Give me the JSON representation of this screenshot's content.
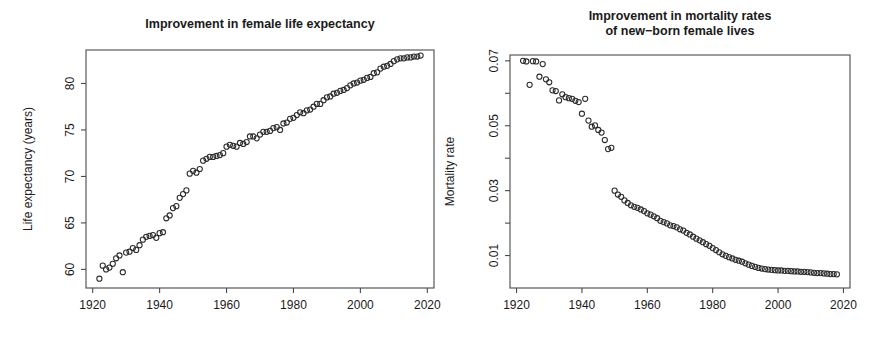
{
  "figure": {
    "background": "#ffffff",
    "point_color": "#2b2b2b",
    "axis_color": "#4a4a4a",
    "text_color": "#1a1a1a"
  },
  "chart_data": [
    {
      "type": "scatter",
      "id": "female-life-expectancy",
      "title": "Improvement in female life expectancy",
      "title_lines": [
        "Improvement in female life expectancy"
      ],
      "xlabel": "",
      "ylabel": "Life expectancy (years)",
      "xlim": [
        1918,
        2022
      ],
      "ylim": [
        58.0,
        83.6
      ],
      "grid": false,
      "legend": "none",
      "xticks": [
        1920,
        1940,
        1960,
        1980,
        2000,
        2020
      ],
      "xtick_labels": [
        "1920",
        "1940",
        "1960",
        "1980",
        "2000",
        "2020"
      ],
      "yticks": [
        60,
        65,
        70,
        75,
        80
      ],
      "ytick_labels": [
        "60",
        "65",
        "70",
        "75",
        "80"
      ],
      "marker": "open-circle",
      "x": [
        1922,
        1923,
        1924,
        1925,
        1926,
        1927,
        1928,
        1929,
        1930,
        1931,
        1932,
        1933,
        1934,
        1935,
        1936,
        1937,
        1938,
        1939,
        1940,
        1941,
        1942,
        1943,
        1944,
        1945,
        1946,
        1947,
        1948,
        1949,
        1950,
        1951,
        1952,
        1953,
        1954,
        1955,
        1956,
        1957,
        1958,
        1959,
        1960,
        1961,
        1962,
        1963,
        1964,
        1965,
        1966,
        1967,
        1968,
        1969,
        1970,
        1971,
        1972,
        1973,
        1974,
        1975,
        1976,
        1977,
        1978,
        1979,
        1980,
        1981,
        1982,
        1983,
        1984,
        1985,
        1986,
        1987,
        1988,
        1989,
        1990,
        1991,
        1992,
        1993,
        1994,
        1995,
        1996,
        1997,
        1998,
        1999,
        2000,
        2001,
        2002,
        2003,
        2004,
        2005,
        2006,
        2007,
        2008,
        2009,
        2010,
        2011,
        2012,
        2013,
        2014,
        2015,
        2016,
        2017,
        2018
      ],
      "y": [
        59.0,
        60.4,
        60.0,
        60.2,
        60.6,
        61.2,
        61.5,
        59.7,
        61.8,
        61.9,
        62.3,
        62.1,
        62.6,
        63.2,
        63.5,
        63.6,
        63.7,
        63.4,
        63.9,
        64.0,
        65.5,
        65.8,
        66.6,
        66.8,
        67.7,
        68.1,
        68.5,
        70.3,
        70.6,
        70.4,
        70.8,
        71.7,
        71.9,
        72.1,
        72.1,
        72.2,
        72.3,
        72.5,
        73.2,
        73.4,
        73.3,
        73.2,
        73.6,
        73.5,
        73.7,
        74.3,
        74.3,
        74.1,
        74.5,
        74.8,
        74.8,
        74.9,
        75.2,
        75.3,
        75.0,
        75.7,
        75.8,
        76.2,
        76.3,
        76.6,
        76.9,
        76.8,
        77.1,
        77.2,
        77.5,
        77.8,
        77.8,
        78.2,
        78.5,
        78.6,
        78.9,
        79.0,
        79.2,
        79.3,
        79.5,
        79.8,
        80.0,
        80.1,
        80.3,
        80.4,
        80.6,
        80.7,
        81.1,
        81.2,
        81.6,
        81.8,
        81.9,
        82.1,
        82.4,
        82.6,
        82.7,
        82.7,
        82.8,
        82.8,
        82.9,
        82.9,
        83.0
      ]
    },
    {
      "type": "scatter",
      "id": "newborn-female-mortality",
      "title": "Improvement in mortality rates of new-born female lives",
      "title_lines": [
        "Improvement in mortality rates",
        "of new−born female lives"
      ],
      "xlabel": "",
      "ylabel": "Mortality rate",
      "xlim": [
        1918,
        2022
      ],
      "ylim": [
        0.0,
        0.0718
      ],
      "grid": false,
      "legend": "none",
      "xticks": [
        1920,
        1940,
        1960,
        1980,
        2000,
        2020
      ],
      "xtick_labels": [
        "1920",
        "1940",
        "1960",
        "1980",
        "2000",
        "2020"
      ],
      "yticks": [
        0.01,
        0.02,
        0.03,
        0.04,
        0.05,
        0.06,
        0.07
      ],
      "ytick_labels": [
        "0.01",
        "",
        "0.03",
        "",
        "0.05",
        "",
        "0.07"
      ],
      "marker": "open-circle",
      "x": [
        1922,
        1923,
        1924,
        1925,
        1926,
        1927,
        1928,
        1929,
        1930,
        1931,
        1932,
        1933,
        1934,
        1935,
        1936,
        1937,
        1938,
        1939,
        1940,
        1941,
        1942,
        1943,
        1944,
        1945,
        1946,
        1947,
        1948,
        1949,
        1950,
        1951,
        1952,
        1953,
        1954,
        1955,
        1956,
        1957,
        1958,
        1959,
        1960,
        1961,
        1962,
        1963,
        1964,
        1965,
        1966,
        1967,
        1968,
        1969,
        1970,
        1971,
        1972,
        1973,
        1974,
        1975,
        1976,
        1977,
        1978,
        1979,
        1980,
        1981,
        1982,
        1983,
        1984,
        1985,
        1986,
        1987,
        1988,
        1989,
        1990,
        1991,
        1992,
        1993,
        1994,
        1995,
        1996,
        1997,
        1998,
        1999,
        2000,
        2001,
        2002,
        2003,
        2004,
        2005,
        2006,
        2007,
        2008,
        2009,
        2010,
        2011,
        2012,
        2013,
        2014,
        2015,
        2016,
        2017,
        2018
      ],
      "y": [
        0.07,
        0.0698,
        0.0626,
        0.0699,
        0.0698,
        0.0651,
        0.069,
        0.0643,
        0.0634,
        0.0609,
        0.0607,
        0.0578,
        0.0597,
        0.0588,
        0.0585,
        0.0583,
        0.0577,
        0.0573,
        0.0537,
        0.0583,
        0.0516,
        0.0497,
        0.0501,
        0.0487,
        0.0479,
        0.0456,
        0.0428,
        0.0432,
        0.03,
        0.0288,
        0.0281,
        0.027,
        0.0262,
        0.0255,
        0.025,
        0.0247,
        0.0242,
        0.0237,
        0.023,
        0.0226,
        0.0221,
        0.0215,
        0.0207,
        0.0203,
        0.0199,
        0.0193,
        0.0191,
        0.0187,
        0.0181,
        0.0177,
        0.017,
        0.0165,
        0.0158,
        0.0152,
        0.0147,
        0.0141,
        0.0135,
        0.013,
        0.0123,
        0.0117,
        0.011,
        0.0104,
        0.0099,
        0.0095,
        0.0091,
        0.0087,
        0.0084,
        0.0081,
        0.0076,
        0.0072,
        0.0068,
        0.0065,
        0.0062,
        0.006,
        0.0058,
        0.0057,
        0.0056,
        0.0055,
        0.0054,
        0.0054,
        0.0053,
        0.0053,
        0.0052,
        0.0051,
        0.0051,
        0.005,
        0.005,
        0.0049,
        0.0048,
        0.0047,
        0.0046,
        0.0046,
        0.0045,
        0.0044,
        0.0043,
        0.0043,
        0.0042
      ]
    }
  ]
}
